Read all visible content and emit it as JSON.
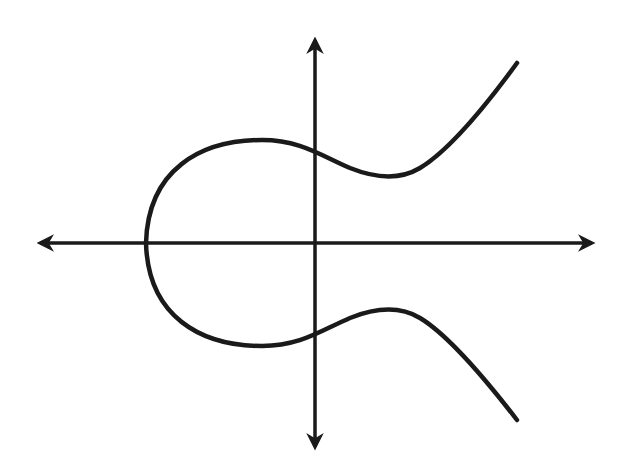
{
  "diagram": {
    "background": "#ffffff",
    "line_color": "#1a1a1a",
    "axes": {
      "origin": [
        315,
        243
      ],
      "x_axis": {
        "from": [
          35,
          243
        ],
        "to": [
          598,
          243
        ]
      },
      "y_axis": {
        "from": [
          315,
          35
        ],
        "to": [
          315,
          452
        ]
      }
    },
    "curve": {
      "type": "elliptic-curve",
      "description": "Closed oval on the left crossing the x-axis near x=145, plus an open branch symmetric about the x-axis extending to the upper and lower right",
      "upper_end": [
        517,
        63
      ],
      "lower_end": [
        517,
        420
      ],
      "upper_local_min": [
        390,
        176
      ],
      "lower_local_max": [
        390,
        310
      ],
      "leftmost_point": [
        145,
        243
      ]
    }
  }
}
